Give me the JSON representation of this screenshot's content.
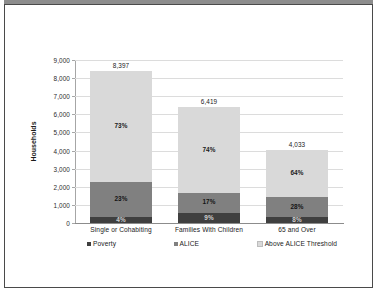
{
  "chart_data": {
    "type": "bar",
    "subtype": "stacked-column",
    "title": "",
    "xlabel": "",
    "ylabel": "Households",
    "ylim": [
      0,
      9000
    ],
    "ytick_labels": [
      "0",
      "1,000",
      "2,000",
      "3,000",
      "4,000",
      "5,000",
      "6,000",
      "7,000",
      "8,000",
      "9,000"
    ],
    "ytick_values": [
      0,
      1000,
      2000,
      3000,
      4000,
      5000,
      6000,
      7000,
      8000,
      9000
    ],
    "grid": true,
    "legend_position": "bottom",
    "categories": [
      "Single or Cohabiting",
      "Families With Children",
      "65 and Over"
    ],
    "totals": [
      "8,397",
      "6,419",
      "4,033"
    ],
    "total_values": [
      8397,
      6419,
      4033
    ],
    "series": [
      {
        "name": "Poverty",
        "color": "#3f3f3f",
        "values": [
          336,
          578,
          323
        ],
        "percent_labels": [
          "4%",
          "9%",
          "8%"
        ]
      },
      {
        "name": "ALICE",
        "color": "#808080",
        "values": [
          1931,
          1091,
          1129
        ],
        "percent_labels": [
          "23%",
          "17%",
          "28%"
        ]
      },
      {
        "name": "Above ALICE Threshold",
        "color": "#d9d9d9",
        "values": [
          6130,
          4750,
          2581
        ],
        "percent_labels": [
          "73%",
          "74%",
          "64%"
        ]
      }
    ]
  }
}
